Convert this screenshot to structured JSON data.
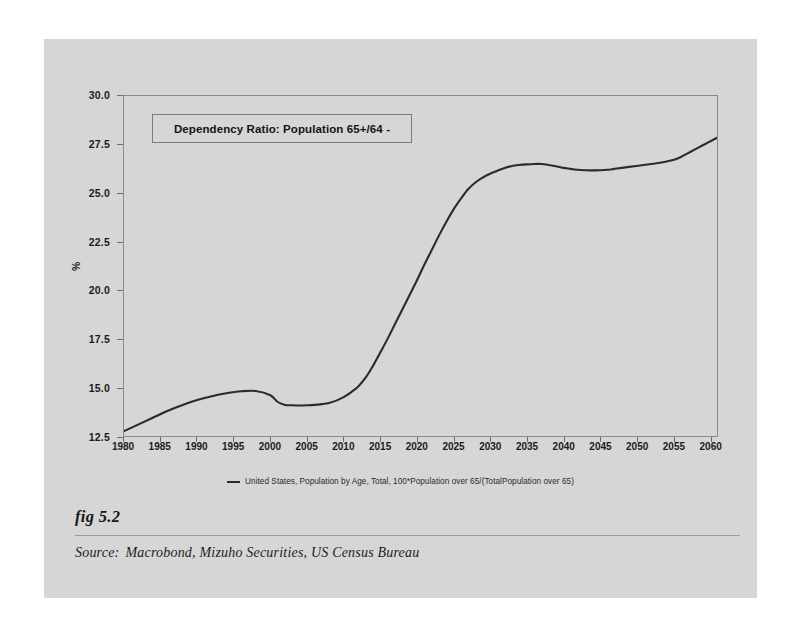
{
  "figure": {
    "fig_label": "fig 5.2",
    "source_label": "Source:",
    "source_text": "Macrobond, Mizuho Securities, US Census Bureau"
  },
  "chart_data": {
    "type": "line",
    "title": "Dependency Ratio: Population 65+/64 -",
    "xlabel": "",
    "ylabel": "%",
    "xlim": [
      1980,
      2061
    ],
    "ylim": [
      12.5,
      30.0
    ],
    "grid": false,
    "legend_position": "bottom",
    "line_color": "#2b2b2b",
    "xticks": [
      1980,
      1985,
      1990,
      1995,
      2000,
      2005,
      2010,
      2015,
      2020,
      2025,
      2030,
      2035,
      2040,
      2045,
      2050,
      2055,
      2060
    ],
    "yticks": [
      12.5,
      15.0,
      17.5,
      20.0,
      22.5,
      25.0,
      27.5,
      30.0
    ],
    "series": [
      {
        "name": "United States, Population by Age, Total, 100*Population over 65/(TotalPopulation over 65)",
        "x": [
          1980,
          1982,
          1984,
          1986,
          1988,
          1990,
          1992,
          1994,
          1996,
          1998,
          2000,
          2001,
          2002,
          2003,
          2004,
          2005,
          2006,
          2007,
          2008,
          2009,
          2010,
          2011,
          2012,
          2013,
          2014,
          2015,
          2016,
          2017,
          2018,
          2019,
          2020,
          2021,
          2022,
          2023,
          2024,
          2025,
          2026,
          2027,
          2028,
          2029,
          2030,
          2031,
          2032,
          2033,
          2034,
          2035,
          2036,
          2037,
          2038,
          2039,
          2040,
          2041,
          2042,
          2043,
          2044,
          2045,
          2046,
          2047,
          2048,
          2049,
          2050,
          2051,
          2052,
          2053,
          2054,
          2055,
          2056,
          2057,
          2058,
          2059,
          2060,
          2061
        ],
        "y": [
          12.75,
          13.1,
          13.45,
          13.8,
          14.1,
          14.35,
          14.55,
          14.7,
          14.8,
          14.82,
          14.6,
          14.25,
          14.1,
          14.08,
          14.07,
          14.08,
          14.1,
          14.14,
          14.2,
          14.32,
          14.5,
          14.75,
          15.05,
          15.5,
          16.1,
          16.8,
          17.5,
          18.25,
          19.0,
          19.75,
          20.5,
          21.3,
          22.05,
          22.8,
          23.5,
          24.15,
          24.7,
          25.2,
          25.55,
          25.8,
          26.0,
          26.15,
          26.3,
          26.4,
          26.45,
          26.48,
          26.5,
          26.5,
          26.45,
          26.38,
          26.3,
          26.25,
          26.2,
          26.18,
          26.17,
          26.18,
          26.2,
          26.25,
          26.3,
          26.35,
          26.4,
          26.45,
          26.5,
          26.55,
          26.62,
          26.7,
          26.85,
          27.05,
          27.25,
          27.45,
          27.65,
          27.85
        ]
      }
    ],
    "legend": [
      {
        "label": "United States, Population by Age, Total, 100*Population over 65/(TotalPopulation over 65)",
        "color": "#2b2b2b"
      }
    ]
  }
}
